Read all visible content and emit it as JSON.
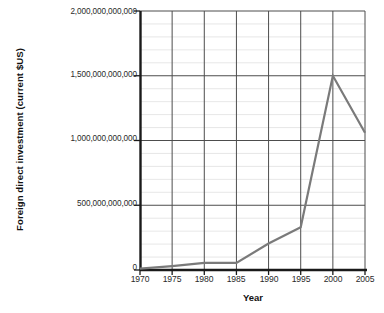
{
  "chart_data": {
    "type": "line",
    "title": "",
    "xlabel": "Year",
    "ylabel": "Foreign direct investment (current $US)",
    "x": [
      1970,
      1975,
      1980,
      1985,
      1990,
      1995,
      2000,
      2005
    ],
    "values": [
      10000000000,
      30000000000,
      55000000000,
      55000000000,
      205000000000,
      330000000000,
      1500000000000,
      1060000000000
    ],
    "series": [
      {
        "name": "Foreign direct investment",
        "values": [
          10000000000,
          30000000000,
          55000000000,
          55000000000,
          205000000000,
          330000000000,
          1500000000000,
          1060000000000
        ]
      }
    ],
    "xlim": [
      1970,
      2005
    ],
    "ylim": [
      0,
      2000000000000
    ],
    "xticks": [
      1970,
      1975,
      1980,
      1985,
      1990,
      1995,
      2000,
      2005
    ],
    "xtick_labels": [
      "1970",
      "1975",
      "1980",
      "1985",
      "1990",
      "1995",
      "2000",
      "2005"
    ],
    "yticks": [
      0,
      500000000000,
      1000000000000,
      1500000000000,
      2000000000000
    ],
    "ytick_labels": [
      "0",
      "500,000,000,000",
      "1,000,000,000,000",
      "1,500,000,000,000",
      "2,000,000,000,000"
    ],
    "grid": true,
    "minor_grid": true,
    "minor_grid_step": 100000000000,
    "legend": null,
    "legend_position": "none",
    "line_color": "#7a7a7a",
    "grid_major_color": "#4d4d4d",
    "grid_minor_color": "#d8d8d8",
    "axis_color": "#1a1a1a",
    "background_color": "#ffffff"
  }
}
